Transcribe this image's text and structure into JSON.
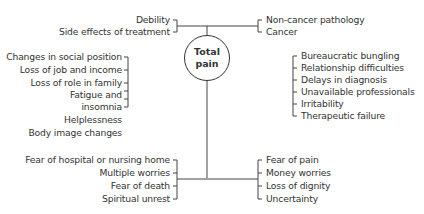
{
  "diagram": {
    "center": {
      "line1": "Total",
      "line2": "pain"
    },
    "top_left": [
      "Debility",
      "Side effects of treatment"
    ],
    "top_right": [
      "Non-cancer pathology",
      "Cancer"
    ],
    "left": [
      "Changes in social position",
      "Loss of job and income",
      "Loss of role in family",
      "Fatigue and",
      "insomnia",
      "Helplessness",
      "Body image changes"
    ],
    "right": [
      "Bureaucratic bungling",
      "Relationship difficulties",
      "Delays in diagnosis",
      "Unavailable professionals",
      "Irritability",
      "Therapeutic failure"
    ],
    "bottom_left": [
      "Fear of hospital or nursing home",
      "Multiple worries",
      "Fear of death",
      "Spiritual unrest"
    ],
    "bottom_right": [
      "Fear of pain",
      "Money worries",
      "Loss of dignity",
      "Uncertainty"
    ]
  }
}
